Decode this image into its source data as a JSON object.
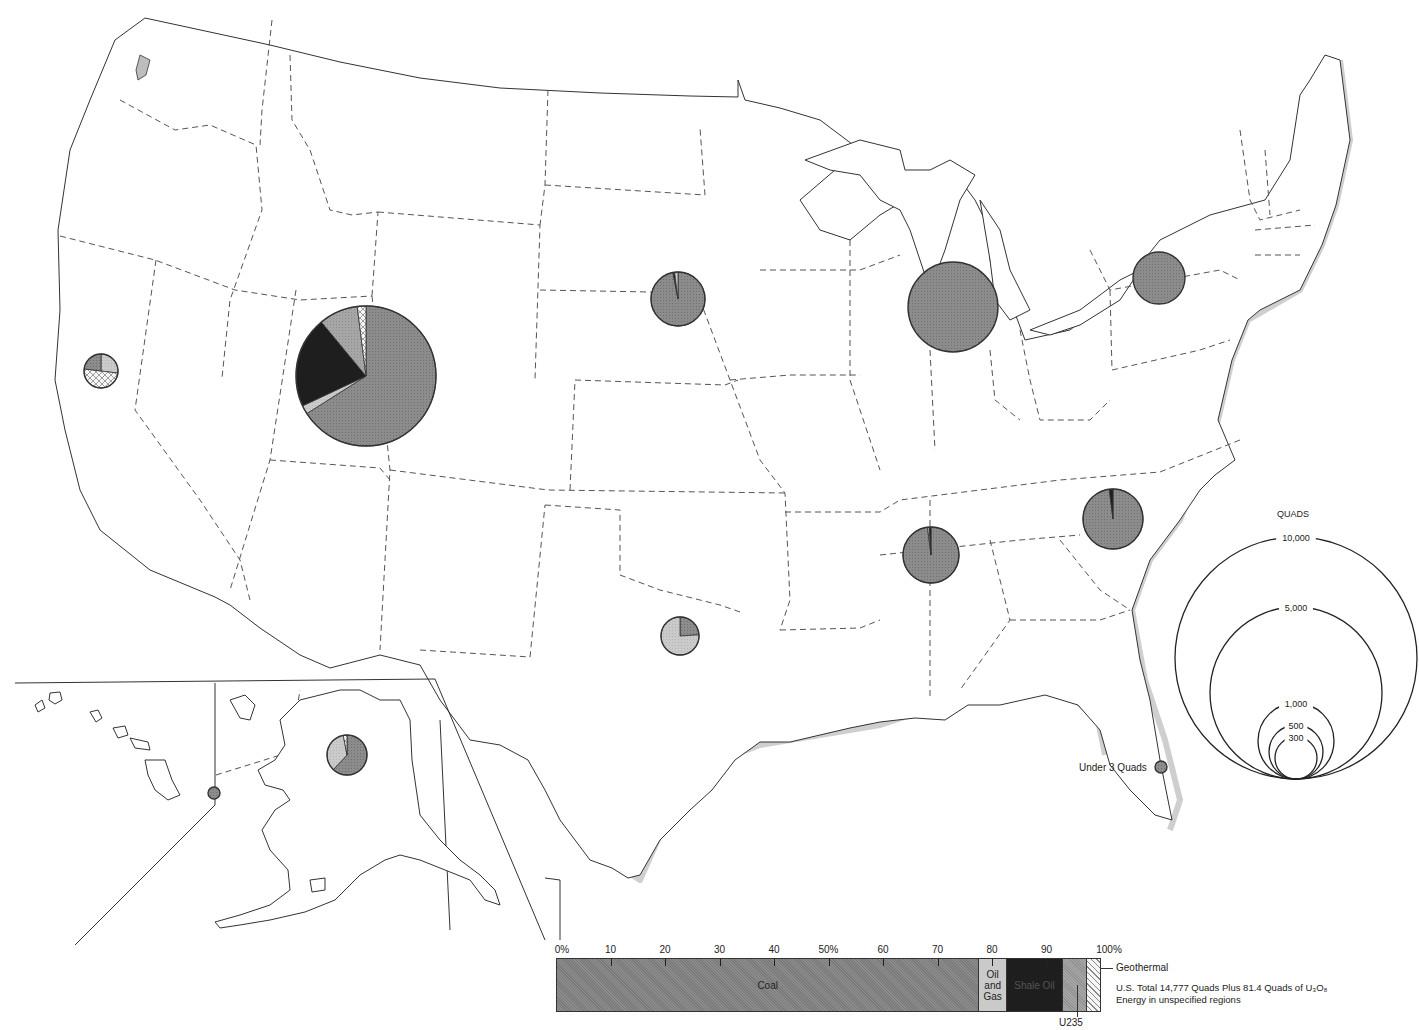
{
  "map": {
    "title": "U.S. Energy Resources by Region (Quads)",
    "unit_label": "QUADS",
    "under_label": "Under 3 Quads",
    "colors": {
      "coal": "#8c8c8c",
      "oil_and_gas": "#c9c9c9",
      "shale_oil": "#1e1e1e",
      "u235": "#a5a5a5",
      "geothermal": "#f2f2f2",
      "outline": "#333333",
      "shadow": "#cfcfcf"
    },
    "regions": [
      {
        "name": "Rocky Mountain / Northern Great Plains",
        "cx": 366,
        "cy": 376,
        "r": 70,
        "slices": [
          {
            "type": "coal",
            "pct": 66
          },
          {
            "type": "oil_and_gas",
            "pct": 2
          },
          {
            "type": "shale_oil",
            "pct": 21
          },
          {
            "type": "u235",
            "pct": 9
          },
          {
            "type": "geothermal",
            "pct": 2
          }
        ]
      },
      {
        "name": "California",
        "cx": 101,
        "cy": 371,
        "r": 17,
        "slices": [
          {
            "type": "oil_and_gas",
            "pct": 27
          },
          {
            "type": "geothermal",
            "pct": 50
          },
          {
            "type": "coal",
            "pct": 23
          }
        ]
      },
      {
        "name": "Dakotas / Nebraska",
        "cx": 678,
        "cy": 299,
        "r": 27,
        "slices": [
          {
            "type": "coal",
            "pct": 97
          },
          {
            "type": "shale_oil",
            "pct": 1
          },
          {
            "type": "oil_and_gas",
            "pct": 2
          }
        ]
      },
      {
        "name": "Illinois / Indiana",
        "cx": 953,
        "cy": 307,
        "r": 45,
        "slices": [
          {
            "type": "coal",
            "pct": 100
          }
        ]
      },
      {
        "name": "Pennsylvania / New York",
        "cx": 1159,
        "cy": 278,
        "r": 26,
        "slices": [
          {
            "type": "coal",
            "pct": 100
          }
        ]
      },
      {
        "name": "Southwest (Texas / Oklahoma)",
        "cx": 680,
        "cy": 636,
        "r": 19,
        "slices": [
          {
            "type": "coal",
            "pct": 24
          },
          {
            "type": "oil_and_gas",
            "pct": 76
          }
        ]
      },
      {
        "name": "Tennessee / Mississippi",
        "cx": 931,
        "cy": 555,
        "r": 28,
        "slices": [
          {
            "type": "coal",
            "pct": 98
          },
          {
            "type": "oil_and_gas",
            "pct": 1
          },
          {
            "type": "shale_oil",
            "pct": 1
          }
        ]
      },
      {
        "name": "Carolinas / Virginia",
        "cx": 1113,
        "cy": 519,
        "r": 30,
        "slices": [
          {
            "type": "coal",
            "pct": 98
          },
          {
            "type": "shale_oil",
            "pct": 2
          }
        ]
      },
      {
        "name": "Alaska",
        "cx": 347,
        "cy": 755,
        "r": 20,
        "slices": [
          {
            "type": "coal",
            "pct": 62
          },
          {
            "type": "oil_and_gas",
            "pct": 35
          },
          {
            "type": "geothermal",
            "pct": 3
          }
        ]
      },
      {
        "name": "Hawaii",
        "cx": 214,
        "cy": 793,
        "r": 6,
        "slices": [
          {
            "type": "coal",
            "pct": 100
          }
        ]
      },
      {
        "name": "Florida (Under 3 Quads)",
        "cx": 1161,
        "cy": 767,
        "r": 6,
        "slices": [
          {
            "type": "coal",
            "pct": 100
          }
        ]
      }
    ],
    "legend_scale": [
      {
        "label": "10,000",
        "r": 121
      },
      {
        "label": "5,000",
        "r": 86
      },
      {
        "label": "1,000",
        "r": 38
      },
      {
        "label": "500",
        "r": 27
      },
      {
        "label": "300",
        "r": 21
      }
    ]
  },
  "bar_chart": {
    "ticks": [
      "0%",
      "10",
      "20",
      "30",
      "40",
      "50%",
      "60",
      "70",
      "80",
      "90",
      "100%"
    ],
    "segments": [
      {
        "key": "coal",
        "label": "Coal",
        "pct": 77.6
      },
      {
        "key": "oil_and_gas",
        "label_lines": [
          "Oil",
          "and",
          "Gas"
        ],
        "pct": 5.1
      },
      {
        "key": "shale_oil",
        "label": "Shale Oil",
        "pct": 10.3
      },
      {
        "key": "u235",
        "label": "",
        "pct": 4.5
      },
      {
        "key": "geothermal",
        "label": "",
        "pct": 2.5
      }
    ],
    "geothermal_label": "Geothermal",
    "u235_label": "U235",
    "total_line_1": "U.S. Total 14,777 Quads Plus 81.4 Quads of U₃O₈",
    "total_line_2": "Energy in unspecified regions"
  },
  "chart_data": {
    "type": "bar",
    "xlabel": "Percent",
    "ylabel": "",
    "categories": [
      "Coal",
      "Oil and Gas",
      "Shale Oil",
      "U235",
      "Geothermal"
    ],
    "values": [
      77.6,
      5.1,
      10.3,
      4.5,
      2.5
    ],
    "xlim": [
      0,
      100
    ],
    "ticks": [
      "0%",
      "10",
      "20",
      "30",
      "40",
      "50%",
      "60",
      "70",
      "80",
      "90",
      "100%"
    ],
    "annotations": [
      "U.S. Total 14,777 Quads Plus 81.4 Quads of U3O8",
      "Energy in unspecified regions"
    ],
    "proportional_circle_legend": {
      "title": "QUADS",
      "values": [
        10000,
        5000,
        1000,
        500,
        300
      ]
    },
    "regional_pies": [
      {
        "region": "Rocky Mountain",
        "approx_quads": 3300,
        "composition": {
          "Coal": 66,
          "Oil and Gas": 2,
          "Shale Oil": 21,
          "U235": 9,
          "Geothermal": 2
        }
      },
      {
        "region": "Illinois basin",
        "approx_quads": 1400,
        "composition": {
          "Coal": 100
        }
      },
      {
        "region": "Appalachian (PA/NY)",
        "approx_quads": 460,
        "composition": {
          "Coal": 100
        }
      },
      {
        "region": "Southeast (Carolinas)",
        "approx_quads": 600,
        "composition": {
          "Coal": 98,
          "Shale Oil": 2
        }
      },
      {
        "region": "Tennessee/Mississippi",
        "approx_quads": 520,
        "composition": {
          "Coal": 98,
          "Oil and Gas": 1,
          "Shale Oil": 1
        }
      },
      {
        "region": "Dakotas/Nebraska",
        "approx_quads": 480,
        "composition": {
          "Coal": 97,
          "Oil and Gas": 2,
          "Shale Oil": 1
        }
      },
      {
        "region": "Alaska",
        "approx_quads": 270,
        "composition": {
          "Coal": 62,
          "Oil and Gas": 35,
          "Geothermal": 3
        }
      },
      {
        "region": "Texas/Oklahoma",
        "approx_quads": 250,
        "composition": {
          "Coal": 24,
          "Oil and Gas": 76
        }
      },
      {
        "region": "California",
        "approx_quads": 200,
        "composition": {
          "Geothermal": 50,
          "Oil and Gas": 27,
          "Coal": 23
        }
      },
      {
        "region": "Hawaii",
        "approx_quads": "Under 3"
      },
      {
        "region": "Florida",
        "approx_quads": "Under 3"
      }
    ]
  }
}
